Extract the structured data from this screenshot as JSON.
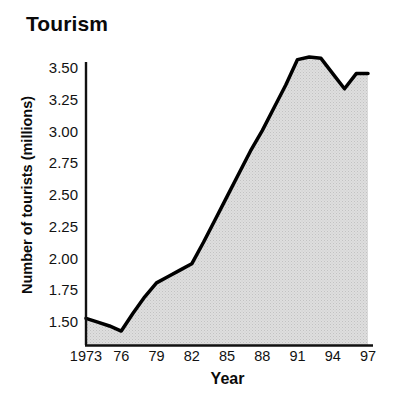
{
  "chart_data": {
    "type": "area",
    "title": "Tourism",
    "xlabel": "Year",
    "ylabel": "Number of tourists (millions)",
    "grid": false,
    "legend": "none",
    "xlim": [
      1973,
      1997
    ],
    "ylim": [
      1.31,
      3.62
    ],
    "y_ticks": [
      1.5,
      1.75,
      2.0,
      2.25,
      2.5,
      2.75,
      3.0,
      3.25,
      3.5
    ],
    "y_tick_labels": [
      "1.50",
      "1.75",
      "2.00",
      "2.25",
      "2.50",
      "2.75",
      "3.00",
      "3.25",
      "3.50"
    ],
    "x_ticks": [
      1973,
      1976,
      1979,
      1982,
      1985,
      1988,
      1991,
      1994,
      1997
    ],
    "x_tick_labels": [
      "1973",
      "76",
      "79",
      "82",
      "85",
      "88",
      "91",
      "94",
      "97"
    ],
    "series": [
      {
        "name": "Number of tourists (millions)",
        "x": [
          1973,
          1974,
          1975,
          1976,
          1977,
          1978,
          1979,
          1980,
          1981,
          1982,
          1983,
          1984,
          1985,
          1986,
          1987,
          1988,
          1989,
          1990,
          1991,
          1992,
          1993,
          1994,
          1995,
          1996,
          1997
        ],
        "values": [
          1.52,
          1.49,
          1.46,
          1.42,
          1.56,
          1.69,
          1.8,
          1.85,
          1.9,
          1.95,
          2.12,
          2.3,
          2.48,
          2.66,
          2.84,
          3.0,
          3.18,
          3.36,
          3.56,
          3.58,
          3.57,
          3.45,
          3.33,
          3.45,
          3.45
        ],
        "fill_color": "#d9d9d9",
        "line_color": "#000000",
        "line_width": 3.5
      }
    ],
    "annotations": {
      "start_value": 1.52,
      "minimum_value": 1.42,
      "minimum_year": 1976,
      "peak_value": 3.58,
      "peak_year": 1992,
      "dip_value": 3.33,
      "dip_year": 1995,
      "end_value": 3.45,
      "end_year": 1997
    }
  },
  "colors": {
    "background": "#ffffff",
    "axis": "#000000",
    "text": "#111111",
    "area_fill": "#d9d9d9"
  }
}
